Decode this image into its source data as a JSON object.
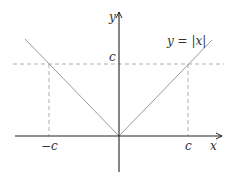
{
  "diagram": {
    "function_label": "y = |x|",
    "axes": {
      "x_label": "x",
      "y_label": "y"
    },
    "ticks": {
      "x_negative": "−c",
      "x_positive": "c",
      "y_level": "c"
    },
    "colors": {
      "axis": "#222222",
      "curve": "#999999",
      "dashed": "#9a9a9a",
      "text": "#333333"
    }
  }
}
